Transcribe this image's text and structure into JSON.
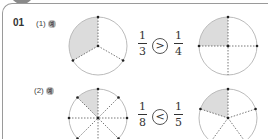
{
  "question": {
    "number": "01",
    "parts": [
      {
        "label": "(1)",
        "example_mark": "예",
        "left_fraction": {
          "numerator": "1",
          "denominator": "3"
        },
        "comparison": ">",
        "right_fraction": {
          "numerator": "1",
          "denominator": "4"
        },
        "left_circle": {
          "divisions": 3,
          "shaded": 1
        },
        "right_circle": {
          "divisions": 4,
          "shaded": 1
        }
      },
      {
        "label": "(2)",
        "example_mark": "예",
        "left_fraction": {
          "numerator": "1",
          "denominator": "8"
        },
        "comparison": "<",
        "right_fraction": {
          "numerator": "1",
          "denominator": "5"
        },
        "left_circle": {
          "divisions": 8,
          "shaded": 1
        },
        "right_circle": {
          "divisions": 5,
          "shaded": 1
        }
      }
    ]
  },
  "colors": {
    "shade": "#dcdcdc",
    "circle": "#bbbbbb",
    "line": "#555555"
  }
}
